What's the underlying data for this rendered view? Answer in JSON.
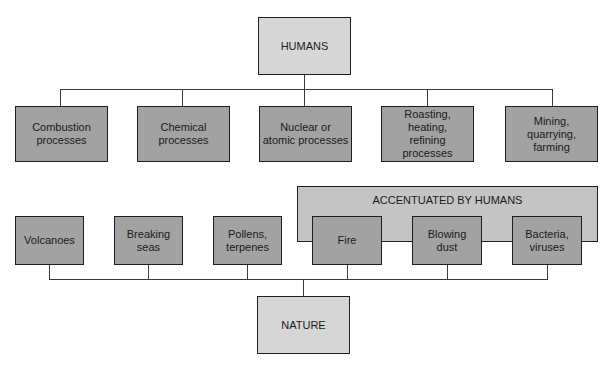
{
  "diagram": {
    "top_node": {
      "label": "HUMANS"
    },
    "bottom_node": {
      "label": "NATURE"
    },
    "human_sources": [
      {
        "label": "Combustion\nprocesses"
      },
      {
        "label": "Chemical\nprocesses"
      },
      {
        "label": "Nuclear or\natomic processes"
      },
      {
        "label": "Roasting,\nheating,\nrefining\nprocesses"
      },
      {
        "label": "Mining,\nquarrying,\nfarming"
      }
    ],
    "accentuated_group": {
      "label": "ACCENTUATED BY HUMANS"
    },
    "natural_sources": [
      {
        "label": "Volcanoes"
      },
      {
        "label": "Breaking\nseas"
      },
      {
        "label": "Pollens,\nterpenes"
      },
      {
        "label": "Fire"
      },
      {
        "label": "Blowing\ndust"
      },
      {
        "label": "Bacteria,\nviruses"
      }
    ],
    "colors": {
      "light_box": "#d6d6d6",
      "dark_box": "#a2a2a2",
      "accent_box": "#c4c4c4",
      "line": "#3a3a3a"
    }
  }
}
